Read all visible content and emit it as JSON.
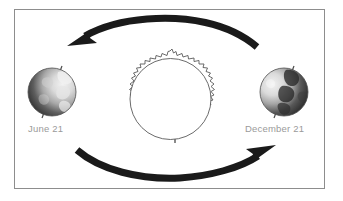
{
  "figure": {
    "background_color": "#ffffff",
    "frame_color": "#8d8d8d"
  },
  "labels": {
    "june": "June 21",
    "december": "December 21",
    "text_color": "#9a9a9a"
  },
  "sun": {
    "name": "sun",
    "center_x": 170,
    "center_y": 98,
    "inner_radius": 42,
    "outer_radius": 47,
    "outline_color": "#5a5a5a",
    "fill_color": "#ffffff"
  },
  "earths": [
    {
      "name": "earth-june",
      "center_x": 52,
      "center_y": 92,
      "radius": 24,
      "lit_side": "right",
      "axis_tilt_deg": 23.5,
      "label": "June 21"
    },
    {
      "name": "earth-december",
      "center_x": 284,
      "center_y": 92,
      "radius": 24,
      "lit_side": "left",
      "axis_tilt_deg": 23.5,
      "label": "December 21"
    }
  ],
  "arrows": [
    {
      "name": "orbit-arrow-top",
      "direction": "right-to-left",
      "points_to": "June 21",
      "color": "#1a1a1a"
    },
    {
      "name": "orbit-arrow-bottom",
      "direction": "left-to-right",
      "points_to": "December 21",
      "color": "#1a1a1a"
    }
  ],
  "colors": {
    "arrow": "#1a1a1a",
    "globe_dark": "#3a3a3a",
    "globe_light": "#d8d8d8",
    "outline": "#5a5a5a"
  }
}
